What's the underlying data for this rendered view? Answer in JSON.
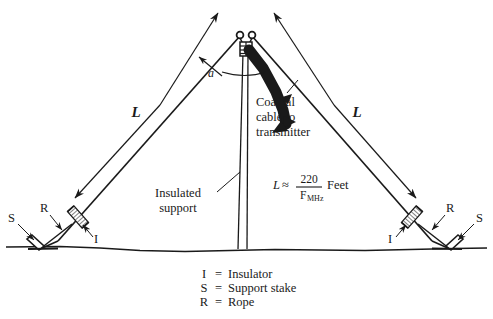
{
  "figure": {
    "type": "inverted-v-antenna-diagram",
    "background_color": "#ffffff",
    "ink_color": "#1a1a1a"
  },
  "labels": {
    "leg_left": "L",
    "leg_right": "L",
    "apex_angle": "a",
    "coax_line1": "Coaxial",
    "coax_line2": "cable to",
    "coax_line3": "transmitter",
    "insulated_support_line1": "Insulated",
    "insulated_support_line2": "support",
    "insulator_left": "I",
    "insulator_right": "I",
    "rope_left": "R",
    "rope_right": "R",
    "stake_left": "S",
    "stake_right": "S"
  },
  "formula": {
    "lhs": "L",
    "relation": "≈",
    "numerator": "220",
    "denominator_base": "F",
    "denominator_sub": "MHz",
    "units": "Feet"
  },
  "legend": {
    "rows": [
      {
        "key": "I",
        "equals": "=",
        "value": "Insulator"
      },
      {
        "key": "S",
        "equals": "=",
        "value": "Support stake"
      },
      {
        "key": "R",
        "equals": "=",
        "value": "Rope"
      }
    ]
  }
}
